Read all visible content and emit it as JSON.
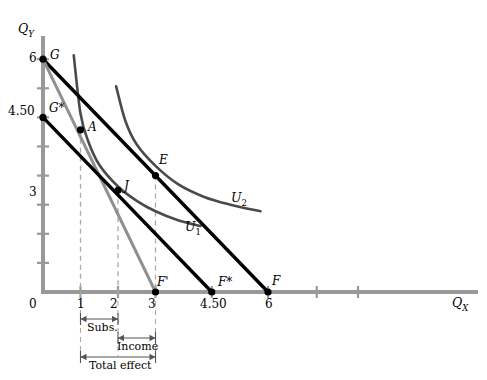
{
  "figure": {
    "type": "economics-indifference-curve-diagram",
    "width": 487,
    "height": 380,
    "background": "#ffffff"
  },
  "axes": {
    "y_title": "Q",
    "y_title_sub": "Y",
    "x_title": "Q",
    "x_title_sub": "X",
    "origin_label": "0",
    "axis_color": "#999999",
    "x_range": [
      0,
      8.6
    ],
    "y_range": [
      0,
      6.8
    ],
    "x_ticks": [
      {
        "value": 1,
        "label": "1"
      },
      {
        "value": 2,
        "label": "2"
      },
      {
        "value": 3,
        "label": "3"
      },
      {
        "value": 4.5,
        "label": "4.50"
      },
      {
        "value": 6,
        "label": "6"
      }
    ],
    "y_ticks": [
      {
        "value": 6,
        "label": "6"
      },
      {
        "value": 4.5,
        "label": "4.50"
      },
      {
        "value": 3,
        "label": "3"
      }
    ]
  },
  "chart_data": {
    "type": "line",
    "title": "",
    "xlabel": "Q_X",
    "ylabel": "Q_Y",
    "xlim": [
      0,
      8.6
    ],
    "ylim": [
      0,
      6.8
    ],
    "grid": false,
    "legend": "inline-curve-labels",
    "series": [
      {
        "name": "budget-line-GF",
        "style": "solid-black-thick",
        "color": "#000000",
        "points": [
          [
            0,
            6
          ],
          [
            6,
            0
          ]
        ],
        "endpoints": [
          "G",
          "F"
        ]
      },
      {
        "name": "budget-line-G-Fprime",
        "style": "solid-gray-thick",
        "color": "#909090",
        "points": [
          [
            0,
            6
          ],
          [
            3,
            0
          ]
        ],
        "endpoints": [
          "G",
          "F'"
        ]
      },
      {
        "name": "compensated-budget-line-Gstar-Fstar",
        "style": "solid-black-thick",
        "color": "#000000",
        "points": [
          [
            0,
            4.5
          ],
          [
            4.5,
            0
          ]
        ],
        "endpoints": [
          "G*",
          "F*"
        ]
      },
      {
        "name": "indifference-curve-U1",
        "style": "solid-dark-gray",
        "color": "#4a4a4a",
        "label": "U",
        "label_sub": "1",
        "points": [
          [
            0.82,
            6.1
          ],
          [
            1.0,
            4.6
          ],
          [
            1.2,
            3.9
          ],
          [
            1.5,
            3.28
          ],
          [
            2.0,
            2.72
          ],
          [
            2.5,
            2.35
          ],
          [
            3.0,
            2.08
          ],
          [
            3.6,
            1.85
          ],
          [
            4.2,
            1.7
          ]
        ]
      },
      {
        "name": "indifference-curve-U2",
        "style": "solid-dark-gray",
        "color": "#4a4a4a",
        "label": "U",
        "label_sub": "2",
        "points": [
          [
            1.95,
            5.3
          ],
          [
            2.2,
            4.4
          ],
          [
            2.5,
            3.8
          ],
          [
            3.0,
            3.25
          ],
          [
            3.6,
            2.78
          ],
          [
            4.3,
            2.45
          ],
          [
            5.0,
            2.25
          ],
          [
            5.8,
            2.08
          ]
        ]
      }
    ],
    "points": [
      {
        "name": "G",
        "label": "G",
        "x": 0,
        "y": 6,
        "marker": "filled-circle"
      },
      {
        "name": "Gstar",
        "label": "G*",
        "x": 0,
        "y": 4.5,
        "marker": "filled-circle"
      },
      {
        "name": "A",
        "label": "A",
        "x": 1,
        "y": 4.18,
        "marker": "filled-circle"
      },
      {
        "name": "J",
        "label": "J",
        "x": 2,
        "y": 2.62,
        "marker": "filled-circle"
      },
      {
        "name": "E",
        "label": "E",
        "x": 3,
        "y": 3,
        "marker": "filled-circle"
      },
      {
        "name": "Fprime",
        "label": "F'",
        "x": 3,
        "y": 0,
        "marker": "filled-circle"
      },
      {
        "name": "Fstar",
        "label": "F*",
        "x": 4.5,
        "y": 0,
        "marker": "filled-circle"
      },
      {
        "name": "F",
        "label": "F",
        "x": 6,
        "y": 0,
        "marker": "filled-circle"
      }
    ],
    "drop_lines": [
      {
        "name": "drop-line-A",
        "x": 1,
        "y_top": 4.18
      },
      {
        "name": "drop-line-J",
        "x": 2,
        "y_top": 2.62
      },
      {
        "name": "drop-line-E",
        "x": 3,
        "y_top": 3
      }
    ],
    "effect_brackets": [
      {
        "name": "substitution-effect",
        "label": "Subs.",
        "from_x": 1,
        "to_x": 2
      },
      {
        "name": "income-effect",
        "label": "Income",
        "from_x": 2,
        "to_x": 3
      },
      {
        "name": "total-effect",
        "label": "Total effect",
        "from_x": 1,
        "to_x": 3
      }
    ]
  },
  "annotations": {
    "u1_label": "U",
    "u1_sub": "1",
    "u2_label": "U",
    "u2_sub": "2"
  },
  "colors": {
    "axis": "#999999",
    "black_line": "#000000",
    "gray_line": "#909090",
    "curve": "#4a4a4a",
    "dashed": "#aaaaaa",
    "bracket": "#555555"
  }
}
